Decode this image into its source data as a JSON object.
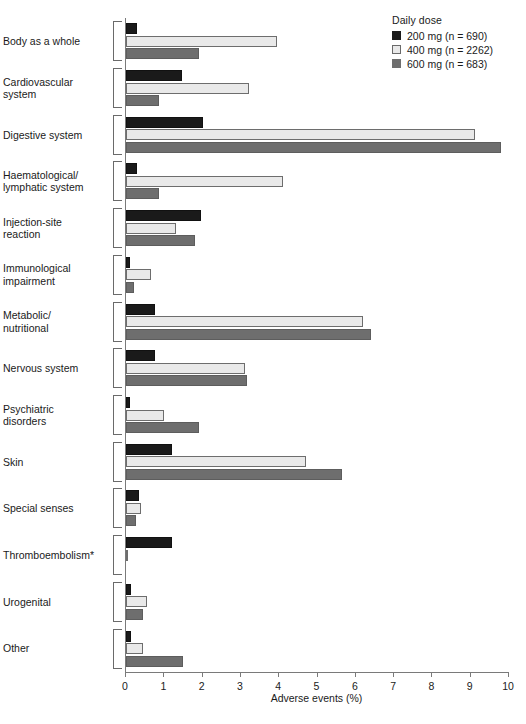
{
  "legend": {
    "title": "Daily dose",
    "entries": [
      {
        "label": "200 mg (n = 690)",
        "color": "#1a1a1a",
        "key": "200mg"
      },
      {
        "label": "400 mg (n = 2262)",
        "color": "#e9e9e9",
        "key": "400mg"
      },
      {
        "label": "600 mg (n = 683)",
        "color": "#6e6e6e",
        "key": "600mg"
      }
    ]
  },
  "axis": {
    "xlabel": "Adverse events (%)",
    "ticks": [
      "0",
      "1",
      "2",
      "3",
      "4",
      "5",
      "6",
      "7",
      "8",
      "9",
      "10"
    ]
  },
  "chart_data": {
    "type": "bar",
    "orientation": "horizontal",
    "title": "",
    "xlabel": "Adverse events (%)",
    "ylabel": "",
    "xlim": [
      0,
      10
    ],
    "grid": false,
    "legend_position": "top-right",
    "legend_title": "Daily dose",
    "footnote": "*",
    "categories": [
      "Body as a whole",
      "Cardiovascular system",
      "Digestive system",
      "Haematological/ lymphatic system",
      "Injection-site reaction",
      "Immunological impairment",
      "Metabolic/ nutritional",
      "Nervous system",
      "Psychiatric disorders",
      "Skin",
      "Special senses",
      "Thromboembolism*",
      "Urogenital",
      "Other"
    ],
    "category_lines": [
      [
        "Body as a whole"
      ],
      [
        "Cardiovascular",
        "system"
      ],
      [
        "Digestive system"
      ],
      [
        "Haematological/",
        "lymphatic system"
      ],
      [
        "Injection-site",
        "reaction"
      ],
      [
        "Immunological",
        "impairment"
      ],
      [
        "Metabolic/",
        "nutritional"
      ],
      [
        "Nervous system"
      ],
      [
        "Psychiatric",
        "disorders"
      ],
      [
        "Skin"
      ],
      [
        "Special senses"
      ],
      [
        "Thromboembolism*"
      ],
      [
        "Urogenital"
      ],
      [
        "Other"
      ]
    ],
    "series": [
      {
        "name": "200 mg (n = 690)",
        "color": "#1a1a1a",
        "values": [
          0.3,
          1.45,
          2.0,
          0.3,
          1.95,
          0.1,
          0.75,
          0.75,
          0.1,
          1.2,
          0.35,
          1.2,
          0.12,
          0.12
        ]
      },
      {
        "name": "400 mg (n = 2262)",
        "color": "#e9e9e9",
        "values": [
          3.95,
          3.2,
          9.1,
          4.1,
          1.3,
          0.65,
          6.2,
          3.1,
          1.0,
          4.7,
          0.4,
          0.05,
          0.55,
          0.45
        ]
      },
      {
        "name": "600 mg (n = 683)",
        "color": "#6e6e6e",
        "values": [
          1.9,
          0.85,
          9.8,
          0.85,
          1.8,
          0.2,
          6.4,
          3.15,
          1.9,
          5.65,
          0.25,
          0.0,
          0.45,
          1.5
        ]
      }
    ]
  }
}
